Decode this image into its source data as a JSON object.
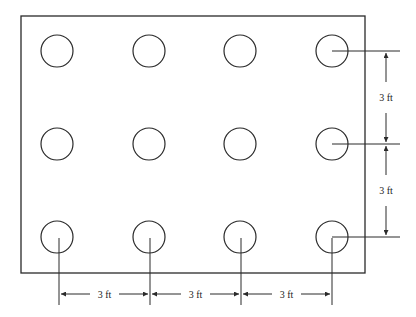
{
  "diagram": {
    "type": "plan-view",
    "colors": {
      "line": "#2a2a2a",
      "background": "#ffffff"
    },
    "grid": {
      "rows": 3,
      "columns": 4
    },
    "dimensions": {
      "horizontal": [
        {
          "label": "3 ft"
        },
        {
          "label": "3 ft"
        },
        {
          "label": "3 ft"
        }
      ],
      "vertical": [
        {
          "label": "3 ft"
        },
        {
          "label": "3 ft"
        }
      ]
    }
  }
}
